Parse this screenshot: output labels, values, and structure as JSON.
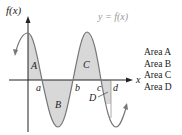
{
  "diagram": {
    "y_axis_label": "f(x)",
    "x_axis_label": "x",
    "curve_label": "y = f(x)",
    "region_labels": [
      "A",
      "B",
      "C",
      "D"
    ],
    "point_labels": [
      "a",
      "b",
      "c",
      "d"
    ],
    "area_list": [
      "Area A",
      "Area B",
      "Area C",
      "Area D"
    ],
    "colors": {
      "curve": "#777777",
      "fill": "#d8d8d8",
      "axis": "#222222",
      "curve_label": "#999999"
    }
  }
}
